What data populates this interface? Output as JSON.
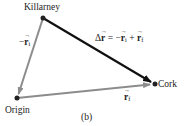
{
  "diagram": {
    "points": [
      {
        "name": "Killarney",
        "x": 43,
        "y": 18
      },
      {
        "name": "Origin",
        "x": 17,
        "y": 98
      },
      {
        "name": "Cork",
        "x": 155,
        "y": 84
      }
    ],
    "labels": {
      "killarney": "Killarney",
      "origin": "Origin",
      "cork": "Cork",
      "caption": "(b)",
      "neg_ri_sign": "−",
      "ri_symbol": "r",
      "ri_sub": "i",
      "rf_symbol": "r",
      "rf_sub": "f",
      "delta_prefix": "Δ",
      "delta_symbol": "r",
      "eq_mid": " = −",
      "eq_plus": " + "
    },
    "arrows": [
      {
        "name": "neg-ri",
        "from": "Killarney",
        "to": "Origin",
        "color": "#8c8c8c"
      },
      {
        "name": "rf",
        "from": "Origin",
        "to": "Cork",
        "color": "#8c8c8c"
      },
      {
        "name": "delta-r",
        "from": "Killarney",
        "to": "Cork",
        "color": "#111111"
      }
    ]
  }
}
